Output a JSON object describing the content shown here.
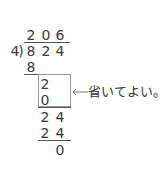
{
  "division": {
    "divisor": "4",
    "dividend": [
      "8",
      "2",
      "4"
    ],
    "quotient": [
      "2",
      "0",
      "6"
    ],
    "steps": [
      {
        "digits": [
          "8"
        ]
      },
      {
        "digits": [
          "2"
        ]
      },
      {
        "digits": [
          "0"
        ]
      },
      {
        "digits": [
          "2",
          "4"
        ]
      },
      {
        "digits": [
          "2",
          "4"
        ]
      },
      {
        "digits": [
          "0"
        ]
      }
    ],
    "bracket": ")"
  },
  "annotation": {
    "arrow": "←",
    "text": "省いてよい。"
  }
}
